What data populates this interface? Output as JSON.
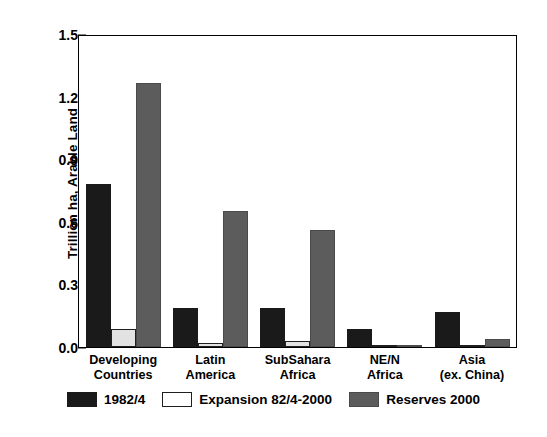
{
  "chart_data": {
    "type": "bar",
    "title": "",
    "subtitle": "",
    "xlabel": "",
    "ylabel": "Trillion ha, Arable Land",
    "ylim": [
      0.0,
      1.5
    ],
    "ytick_values": [
      0.0,
      0.3,
      0.6,
      0.9,
      1.2,
      1.5
    ],
    "ytick_labels": [
      "0.0",
      "0.3",
      "0.6",
      "0.9",
      "1.2",
      "1.5"
    ],
    "grid": false,
    "legend_position": "bottom",
    "categories": [
      "Developing Countries",
      "Latin America",
      "SubSahara Africa",
      "NE/N Africa",
      "Asia (ex. China)"
    ],
    "category_lines": [
      [
        "Developing",
        "Countries"
      ],
      [
        "Latin",
        "America"
      ],
      [
        "SubSahara",
        "Africa"
      ],
      [
        "NE/N",
        "Africa"
      ],
      [
        "Asia",
        "(ex. China)"
      ]
    ],
    "series": [
      {
        "name": "1982/4",
        "color": "#1a1a1a",
        "values": [
          0.79,
          0.19,
          0.19,
          0.09,
          0.17
        ]
      },
      {
        "name": "Expansion 82/4-2000",
        "color": "#ffffff",
        "values": [
          0.09,
          0.02,
          0.03,
          0.0,
          0.01
        ]
      },
      {
        "name": "Reserves 2000",
        "color": "#5c5c5c",
        "values": [
          1.28,
          0.66,
          0.57,
          0.01,
          0.04
        ]
      }
    ]
  },
  "legend": {
    "items": [
      {
        "label": "1982/4",
        "swatch": "series-a"
      },
      {
        "label": "Expansion 82/4-2000",
        "swatch": "series-b"
      },
      {
        "label": "Reserves 2000",
        "swatch": "series-c"
      }
    ]
  }
}
